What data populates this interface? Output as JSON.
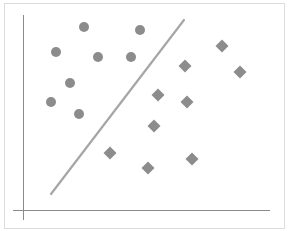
{
  "chart_data": {
    "type": "scatter",
    "title": "",
    "xlabel": "",
    "ylabel": "",
    "grid": false,
    "legend": null,
    "series": [
      {
        "name": "class-circles",
        "marker": "circle",
        "color": "#8c8c8c",
        "points": [
          [
            84,
            27
          ],
          [
            140,
            30
          ],
          [
            56,
            52
          ],
          [
            98,
            57
          ],
          [
            131,
            57
          ],
          [
            70,
            83
          ],
          [
            51,
            102
          ],
          [
            79,
            114
          ]
        ]
      },
      {
        "name": "class-diamonds",
        "marker": "diamond",
        "color": "#8c8c8c",
        "points": [
          [
            222,
            46
          ],
          [
            185,
            66
          ],
          [
            240,
            72
          ],
          [
            158,
            95
          ],
          [
            187,
            102
          ],
          [
            154,
            126
          ],
          [
            110,
            153
          ],
          [
            148,
            168
          ],
          [
            192,
            159
          ]
        ]
      }
    ],
    "boundary_line": {
      "x1": 51,
      "y1": 194,
      "x2": 184,
      "y2": 20,
      "color": "#a6a6a6"
    },
    "axes": {
      "y_axis": {
        "x": 23,
        "y1": 15,
        "y2": 220
      },
      "x_axis": {
        "y": 210,
        "x1": 13,
        "x2": 270
      },
      "color": "#8a8a8a"
    },
    "frame": {
      "x": 4,
      "y": 3,
      "width": 280,
      "height": 225,
      "color": "#dcdcdc"
    }
  }
}
